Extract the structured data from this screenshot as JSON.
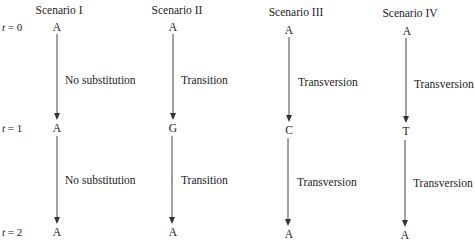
{
  "time_labels": [
    {
      "var": "t",
      "value": "= 0"
    },
    {
      "var": "t",
      "value": "= 1"
    },
    {
      "var": "t",
      "value": "= 2"
    }
  ],
  "scenarios": [
    {
      "name": "Scenario I",
      "bases": [
        "A",
        "A",
        "A"
      ],
      "steps": [
        "No substitution",
        "No substitution"
      ]
    },
    {
      "name": "Scenario II",
      "bases": [
        "A",
        "G",
        "A"
      ],
      "steps": [
        "Transition",
        "Transition"
      ]
    },
    {
      "name": "Scenario III",
      "bases": [
        "A",
        "C",
        "A"
      ],
      "steps": [
        "Transversion",
        "Transversion"
      ]
    },
    {
      "name": "Scenario IV",
      "bases": [
        "A",
        "T",
        "A"
      ],
      "steps": [
        "Transversion",
        "Transversion"
      ]
    }
  ],
  "colors": {
    "ink": "#222222",
    "arrow": "#444444"
  }
}
